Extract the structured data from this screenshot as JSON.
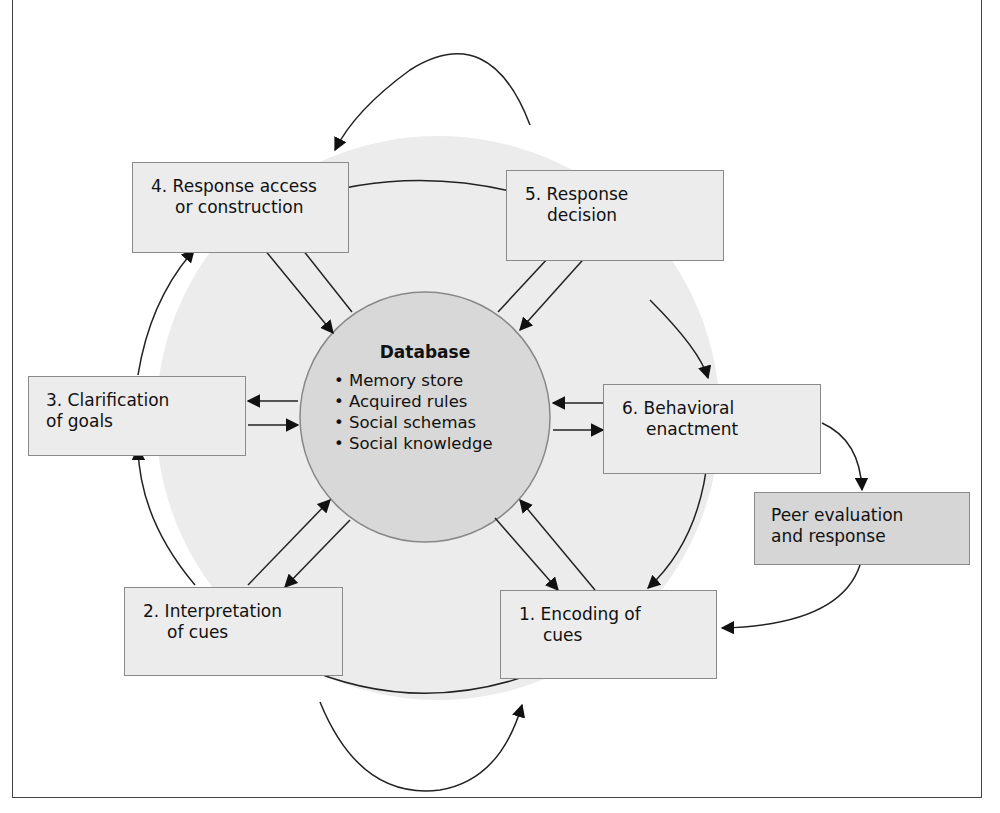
{
  "diagram": {
    "type": "social information processing model",
    "center": {
      "title": "Database",
      "items": [
        "• Memory store",
        "• Acquired rules",
        "• Social schemas",
        "• Social knowledge"
      ]
    },
    "steps": [
      {
        "id": "1",
        "lines": [
          "1. Encoding of",
          "cues"
        ]
      },
      {
        "id": "2",
        "lines": [
          "2. Interpretation",
          "of cues"
        ]
      },
      {
        "id": "3",
        "lines": [
          "3. Clarification",
          "of goals"
        ]
      },
      {
        "id": "4",
        "lines": [
          "4. Response access",
          "or construction"
        ]
      },
      {
        "id": "5",
        "lines": [
          "5. Response",
          "decision"
        ]
      },
      {
        "id": "6",
        "lines": [
          "6. Behavioral",
          "enactment"
        ]
      }
    ],
    "external": {
      "lines": [
        "Peer evaluation",
        "and response"
      ]
    },
    "colors": {
      "outer_circle": "#ececec",
      "database_circle": "#d8d8d8",
      "box_fill": "#ececec",
      "peer_box_fill": "#d6d6d6",
      "stroke": "#222222"
    }
  }
}
